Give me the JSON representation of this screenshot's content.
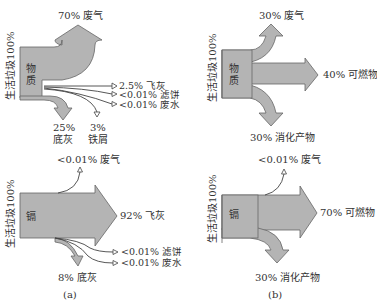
{
  "colors": {
    "flow_fill": "#b4b4b4",
    "flow_stroke": "#666666",
    "text": "#333333"
  },
  "panels": [
    {
      "id": "a-top",
      "input_label": "生活垃圾100%",
      "inner_label": [
        "物",
        "质"
      ],
      "outputs": [
        {
          "label": "70% 废气",
          "value": 70,
          "type": "thick"
        },
        {
          "label": "2.5% 飞灰",
          "value": 2.5,
          "type": "thin"
        },
        {
          "label": "<0.01% 滤饼",
          "value": "<0.01",
          "type": "thin"
        },
        {
          "label": "<0.01% 废水",
          "value": "<0.01",
          "type": "thin"
        },
        {
          "label_line1": "25%",
          "label_line2": "底灰",
          "value": 25,
          "type": "thick"
        },
        {
          "label_line1": "3%",
          "label_line2": "铁屑",
          "value": 3,
          "type": "thin"
        }
      ]
    },
    {
      "id": "b-top",
      "input_label": "生活垃圾100%",
      "inner_label": [
        "物",
        "质"
      ],
      "outputs": [
        {
          "label": "30% 废气",
          "value": 30,
          "type": "thick"
        },
        {
          "label": "40% 可燃物",
          "value": 40,
          "type": "thick"
        },
        {
          "label": "30% 消化产物",
          "value": 30,
          "type": "thick"
        }
      ]
    },
    {
      "id": "a-bottom",
      "input_label": "生活垃圾100%",
      "inner_label": [
        "镉"
      ],
      "outputs": [
        {
          "label": "<0.01% 废气",
          "value": "<0.01",
          "type": "thin"
        },
        {
          "label": "92% 飞灰",
          "value": 92,
          "type": "thick"
        },
        {
          "label": "<0.01% 滤饼",
          "value": "<0.01",
          "type": "thin"
        },
        {
          "label": "<0.01% 废水",
          "value": "<0.01",
          "type": "thin"
        },
        {
          "label": "8% 底灰",
          "value": 8,
          "type": "thick"
        }
      ]
    },
    {
      "id": "b-bottom",
      "input_label": "生活垃圾100%",
      "inner_label": [
        "镉"
      ],
      "outputs": [
        {
          "label": "<0.01% 废气",
          "value": "<0.01",
          "type": "thin"
        },
        {
          "label": "70% 可燃物",
          "value": 70,
          "type": "thick"
        },
        {
          "label": "30% 消化产物",
          "value": 30,
          "type": "thick"
        }
      ]
    }
  ],
  "captions": {
    "a": "(a)",
    "b": "(b)"
  }
}
